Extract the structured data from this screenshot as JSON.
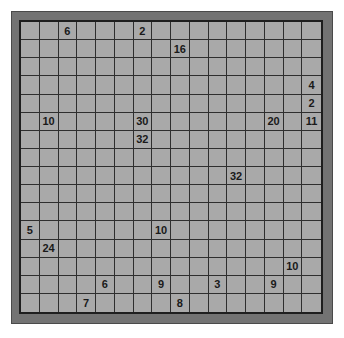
{
  "puzzle": {
    "rows": 16,
    "cols": 16,
    "colors": {
      "frame": "#737373",
      "cell": "#a9a9a9",
      "line": "#2e2e2e",
      "text": "#1a1a1a"
    },
    "clues": [
      {
        "row": 0,
        "col": 2,
        "value": "6"
      },
      {
        "row": 0,
        "col": 6,
        "value": "2"
      },
      {
        "row": 1,
        "col": 8,
        "value": "16"
      },
      {
        "row": 3,
        "col": 15,
        "value": "4"
      },
      {
        "row": 4,
        "col": 15,
        "value": "2"
      },
      {
        "row": 5,
        "col": 1,
        "value": "10"
      },
      {
        "row": 5,
        "col": 6,
        "value": "30"
      },
      {
        "row": 5,
        "col": 13,
        "value": "20"
      },
      {
        "row": 5,
        "col": 15,
        "value": "11"
      },
      {
        "row": 6,
        "col": 6,
        "value": "32"
      },
      {
        "row": 8,
        "col": 11,
        "value": "32"
      },
      {
        "row": 11,
        "col": 0,
        "value": "5"
      },
      {
        "row": 11,
        "col": 7,
        "value": "10"
      },
      {
        "row": 12,
        "col": 1,
        "value": "24"
      },
      {
        "row": 13,
        "col": 14,
        "value": "10"
      },
      {
        "row": 14,
        "col": 4,
        "value": "6"
      },
      {
        "row": 14,
        "col": 7,
        "value": "9"
      },
      {
        "row": 14,
        "col": 10,
        "value": "3"
      },
      {
        "row": 14,
        "col": 13,
        "value": "9"
      },
      {
        "row": 15,
        "col": 3,
        "value": "7"
      },
      {
        "row": 15,
        "col": 8,
        "value": "8"
      }
    ]
  }
}
